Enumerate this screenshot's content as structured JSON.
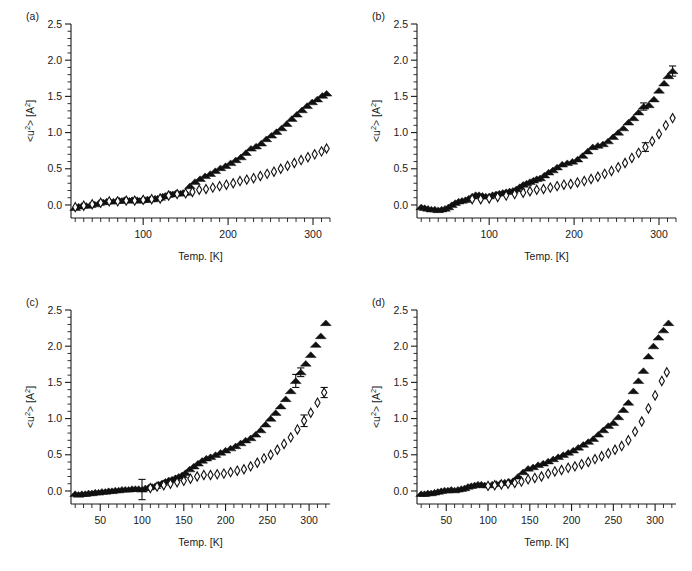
{
  "figure": {
    "background": "#ffffff",
    "ink_color": "#1a1a1a",
    "panel_labels": [
      "(a)",
      "(b)",
      "(c)",
      "(d)"
    ]
  },
  "axis": {
    "xlabel": "Temp. [K]",
    "ylabel_main": "<u",
    "ylabel_sup1": "2",
    "ylabel_mid": "> [A",
    "ylabel_sup2": "2",
    "ylabel_end": "]",
    "ylabel_plain": "<u2> [A2]"
  },
  "chart_data": [
    {
      "type": "scatter",
      "panel": "(a)",
      "title": "(a)",
      "xlabel": "Temp. [K]",
      "ylabel": "<u2> [A2]",
      "xlim": [
        15,
        320
      ],
      "ylim": [
        -0.18,
        2.5
      ],
      "xticks": [
        100,
        200,
        300
      ],
      "xticklabels": [
        "100",
        "200",
        "300"
      ],
      "xminor_step": 10,
      "yticks": [
        0.0,
        0.5,
        1.0,
        1.5,
        2.0,
        2.5
      ],
      "yticklabels": [
        "0.0",
        "0.5",
        "1.0",
        "1.5",
        "2.0",
        "2.5"
      ],
      "yminor_step": 0.1,
      "grid": false,
      "legend": "none",
      "series": [
        {
          "name": "filled-triangle",
          "marker": "triangle-up",
          "fill": "#111111",
          "x": [
            20,
            24,
            28,
            33,
            38,
            43,
            48,
            53,
            57,
            61,
            65,
            69,
            72,
            75,
            78,
            81,
            84,
            87,
            90,
            93,
            96,
            99,
            102,
            105,
            108,
            111,
            114,
            117,
            120,
            123,
            126,
            129,
            132,
            135,
            138,
            141,
            144,
            147,
            150,
            155,
            161,
            167,
            173,
            179,
            185,
            191,
            197,
            203,
            209,
            215,
            221,
            227,
            233,
            239,
            245,
            251,
            257,
            263,
            269,
            275,
            281,
            287,
            293,
            299,
            305,
            311,
            316
          ],
          "y": [
            -0.04,
            -0.02,
            -0.01,
            -0.01,
            0.0,
            0.01,
            0.03,
            0.04,
            0.05,
            0.05,
            0.05,
            0.06,
            0.06,
            0.06,
            0.07,
            0.07,
            0.06,
            0.07,
            0.07,
            0.07,
            0.06,
            0.07,
            0.07,
            0.08,
            0.08,
            0.08,
            0.09,
            0.09,
            0.1,
            0.12,
            0.13,
            0.14,
            0.15,
            0.15,
            0.16,
            0.16,
            0.16,
            0.17,
            0.17,
            0.26,
            0.32,
            0.36,
            0.4,
            0.43,
            0.47,
            0.51,
            0.54,
            0.58,
            0.62,
            0.66,
            0.72,
            0.78,
            0.81,
            0.85,
            0.91,
            0.96,
            1.01,
            1.06,
            1.12,
            1.19,
            1.25,
            1.31,
            1.37,
            1.42,
            1.46,
            1.51,
            1.54
          ]
        },
        {
          "name": "open-diamond",
          "marker": "diamond-open",
          "fill": "none",
          "x": [
            20,
            30,
            40,
            50,
            60,
            70,
            80,
            90,
            100,
            110,
            120,
            130,
            140,
            150,
            158,
            166,
            174,
            182,
            190,
            198,
            206,
            214,
            222,
            230,
            238,
            246,
            254,
            262,
            270,
            278,
            286,
            294,
            302,
            310,
            316
          ],
          "y": [
            -0.03,
            -0.01,
            0.01,
            0.03,
            0.05,
            0.05,
            0.06,
            0.06,
            0.07,
            0.08,
            0.09,
            0.13,
            0.15,
            0.16,
            0.18,
            0.21,
            0.22,
            0.24,
            0.26,
            0.28,
            0.3,
            0.33,
            0.35,
            0.37,
            0.4,
            0.43,
            0.46,
            0.5,
            0.54,
            0.58,
            0.62,
            0.66,
            0.7,
            0.74,
            0.78
          ]
        }
      ]
    },
    {
      "type": "scatter",
      "panel": "(b)",
      "title": "(b)",
      "xlabel": "Temp. [K]",
      "ylabel": "<u2> [A2]",
      "xlim": [
        15,
        320
      ],
      "ylim": [
        -0.18,
        2.5
      ],
      "xticks": [
        100,
        200,
        300
      ],
      "xticklabels": [
        "100",
        "200",
        "300"
      ],
      "xminor_step": 10,
      "yticks": [
        0.0,
        0.5,
        1.0,
        1.5,
        2.0,
        2.5
      ],
      "yticklabels": [
        "0.0",
        "0.5",
        "1.0",
        "1.5",
        "2.0",
        "2.5"
      ],
      "yminor_step": 0.1,
      "grid": false,
      "legend": "none",
      "series": [
        {
          "name": "filled-triangle",
          "marker": "triangle-up",
          "fill": "#111111",
          "x": [
            20,
            24,
            28,
            32,
            36,
            40,
            44,
            48,
            52,
            56,
            60,
            64,
            68,
            72,
            76,
            80,
            84,
            88,
            92,
            96,
            100,
            104,
            108,
            112,
            116,
            120,
            124,
            128,
            132,
            136,
            140,
            144,
            148,
            152,
            156,
            160,
            165,
            170,
            175,
            180,
            186,
            192,
            198,
            204,
            210,
            216,
            222,
            228,
            234,
            240,
            246,
            252,
            258,
            264,
            270,
            276,
            282,
            288,
            294,
            300,
            306,
            311,
            316
          ],
          "y": [
            -0.03,
            -0.04,
            -0.05,
            -0.06,
            -0.06,
            -0.07,
            -0.06,
            -0.05,
            -0.03,
            0.0,
            0.03,
            0.05,
            0.06,
            0.07,
            0.09,
            0.12,
            0.14,
            0.14,
            0.13,
            0.12,
            0.12,
            0.14,
            0.15,
            0.16,
            0.17,
            0.18,
            0.19,
            0.2,
            0.22,
            0.25,
            0.28,
            0.3,
            0.32,
            0.34,
            0.36,
            0.37,
            0.41,
            0.45,
            0.48,
            0.52,
            0.56,
            0.58,
            0.6,
            0.63,
            0.68,
            0.74,
            0.8,
            0.82,
            0.84,
            0.88,
            0.94,
            1.0,
            1.06,
            1.14,
            1.2,
            1.28,
            1.36,
            1.38,
            1.46,
            1.58,
            1.68,
            1.78,
            1.85
          ],
          "errorbars": [
            {
              "x": 282,
              "y": 1.36,
              "err": 0.05
            },
            {
              "x": 316,
              "y": 1.85,
              "err": 0.07
            }
          ]
        },
        {
          "name": "open-diamond",
          "marker": "diamond-open",
          "fill": "none",
          "x": [
            80,
            90,
            100,
            110,
            120,
            130,
            140,
            148,
            156,
            164,
            172,
            180,
            188,
            196,
            204,
            212,
            220,
            228,
            236,
            244,
            252,
            260,
            268,
            276,
            284,
            292,
            300,
            308,
            316
          ],
          "y": [
            0.08,
            0.08,
            0.09,
            0.11,
            0.13,
            0.15,
            0.17,
            0.19,
            0.21,
            0.22,
            0.24,
            0.26,
            0.28,
            0.29,
            0.31,
            0.33,
            0.36,
            0.39,
            0.43,
            0.47,
            0.52,
            0.58,
            0.65,
            0.72,
            0.8,
            0.88,
            0.98,
            1.1,
            1.2
          ],
          "errorbars": [
            {
              "x": 284,
              "y": 0.8,
              "err": 0.06
            }
          ]
        }
      ]
    },
    {
      "type": "scatter",
      "panel": "(c)",
      "title": "(c)",
      "xlabel": "Temp. [K]",
      "ylabel": "<u2> [A2]",
      "xlim": [
        15,
        325
      ],
      "ylim": [
        -0.18,
        2.5
      ],
      "xticks": [
        50,
        100,
        150,
        200,
        250,
        300
      ],
      "xticklabels": [
        "50",
        "100",
        "150",
        "200",
        "250",
        "300"
      ],
      "xminor_step": 10,
      "yticks": [
        0.0,
        0.5,
        1.0,
        1.5,
        2.0,
        2.5
      ],
      "yticklabels": [
        "0.0",
        "0.5",
        "1.0",
        "1.5",
        "2.0",
        "2.5"
      ],
      "yminor_step": 0.1,
      "grid": false,
      "legend": "none",
      "series": [
        {
          "name": "filled-triangle",
          "marker": "triangle-up",
          "fill": "#111111",
          "x": [
            20,
            24,
            28,
            32,
            36,
            40,
            44,
            48,
            52,
            56,
            60,
            64,
            68,
            72,
            76,
            80,
            84,
            88,
            92,
            96,
            100,
            104,
            108,
            112,
            116,
            120,
            124,
            128,
            132,
            136,
            140,
            144,
            148,
            152,
            157,
            162,
            167,
            172,
            177,
            182,
            188,
            194,
            200,
            206,
            212,
            218,
            224,
            230,
            236,
            242,
            248,
            254,
            260,
            266,
            272,
            278,
            284,
            290,
            296,
            302,
            308,
            314,
            320
          ],
          "y": [
            -0.04,
            -0.05,
            -0.04,
            -0.04,
            -0.03,
            -0.03,
            -0.02,
            -0.02,
            -0.01,
            -0.01,
            0.0,
            0.0,
            0.01,
            0.01,
            0.02,
            0.02,
            0.02,
            0.03,
            0.03,
            0.03,
            0.02,
            0.04,
            0.05,
            0.06,
            0.07,
            0.09,
            0.11,
            0.13,
            0.15,
            0.16,
            0.18,
            0.2,
            0.22,
            0.25,
            0.3,
            0.34,
            0.38,
            0.42,
            0.45,
            0.47,
            0.5,
            0.53,
            0.56,
            0.59,
            0.62,
            0.66,
            0.7,
            0.73,
            0.78,
            0.84,
            0.92,
            1.0,
            1.08,
            1.17,
            1.27,
            1.38,
            1.52,
            1.64,
            1.76,
            1.88,
            2.02,
            2.14,
            2.32
          ],
          "errorbars": [
            {
              "x": 100,
              "y": 0.02,
              "err": 0.14
            },
            {
              "x": 284,
              "y": 1.52,
              "err": 0.09
            },
            {
              "x": 290,
              "y": 1.64,
              "err": 0.06
            }
          ]
        },
        {
          "name": "open-diamond",
          "marker": "diamond-open",
          "fill": "none",
          "x": [
            110,
            118,
            126,
            134,
            142,
            150,
            158,
            166,
            174,
            182,
            190,
            198,
            206,
            214,
            222,
            230,
            238,
            246,
            254,
            262,
            270,
            278,
            286,
            294,
            302,
            310,
            318
          ],
          "y": [
            0.04,
            0.06,
            0.08,
            0.1,
            0.12,
            0.14,
            0.17,
            0.2,
            0.22,
            0.22,
            0.23,
            0.24,
            0.26,
            0.28,
            0.3,
            0.34,
            0.39,
            0.45,
            0.5,
            0.57,
            0.65,
            0.74,
            0.85,
            0.97,
            1.08,
            1.22,
            1.36
          ],
          "errorbars": [
            {
              "x": 294,
              "y": 0.97,
              "err": 0.08
            },
            {
              "x": 318,
              "y": 1.36,
              "err": 0.07
            }
          ]
        }
      ]
    },
    {
      "type": "scatter",
      "panel": "(d)",
      "title": "(d)",
      "xlabel": "Temp. [K]",
      "ylabel": "<u2> [A2]",
      "xlim": [
        15,
        325
      ],
      "ylim": [
        -0.18,
        2.5
      ],
      "xticks": [
        50,
        100,
        150,
        200,
        250,
        300
      ],
      "xticklabels": [
        "50",
        "100",
        "150",
        "200",
        "250",
        "300"
      ],
      "xminor_step": 10,
      "yticks": [
        0.0,
        0.5,
        1.0,
        1.5,
        2.0,
        2.5
      ],
      "yticklabels": [
        "0.0",
        "0.5",
        "1.0",
        "1.5",
        "2.0",
        "2.5"
      ],
      "yminor_step": 0.1,
      "grid": false,
      "legend": "none",
      "series": [
        {
          "name": "filled-triangle",
          "marker": "triangle-up",
          "fill": "#111111",
          "x": [
            20,
            24,
            28,
            32,
            36,
            40,
            44,
            48,
            52,
            56,
            60,
            64,
            68,
            72,
            76,
            80,
            84,
            88,
            92,
            96,
            100,
            105,
            110,
            115,
            120,
            125,
            130,
            136,
            142,
            148,
            154,
            160,
            166,
            172,
            178,
            184,
            190,
            196,
            202,
            208,
            214,
            220,
            226,
            232,
            238,
            244,
            250,
            256,
            262,
            268,
            274,
            280,
            286,
            292,
            298,
            304,
            310,
            316
          ],
          "y": [
            -0.04,
            -0.04,
            -0.03,
            -0.03,
            -0.02,
            -0.01,
            0.0,
            0.01,
            0.01,
            0.02,
            0.01,
            0.02,
            0.03,
            0.04,
            0.06,
            0.07,
            0.08,
            0.09,
            0.09,
            0.08,
            0.08,
            0.09,
            0.1,
            0.11,
            0.12,
            0.13,
            0.14,
            0.2,
            0.26,
            0.31,
            0.33,
            0.36,
            0.38,
            0.41,
            0.44,
            0.47,
            0.5,
            0.53,
            0.56,
            0.6,
            0.64,
            0.68,
            0.72,
            0.78,
            0.84,
            0.9,
            0.94,
            1.02,
            1.12,
            1.22,
            1.38,
            1.52,
            1.66,
            1.86,
            2.0,
            2.12,
            2.22,
            2.32
          ]
        },
        {
          "name": "open-diamond",
          "marker": "diamond-open",
          "fill": "none",
          "x": [
            100,
            108,
            116,
            124,
            132,
            140,
            148,
            156,
            164,
            172,
            180,
            188,
            196,
            204,
            212,
            220,
            228,
            236,
            244,
            252,
            260,
            268,
            276,
            284,
            292,
            300,
            308,
            314
          ],
          "y": [
            0.07,
            0.08,
            0.09,
            0.1,
            0.11,
            0.13,
            0.16,
            0.18,
            0.2,
            0.24,
            0.27,
            0.29,
            0.32,
            0.34,
            0.37,
            0.4,
            0.44,
            0.48,
            0.52,
            0.57,
            0.62,
            0.7,
            0.82,
            0.96,
            1.14,
            1.32,
            1.52,
            1.64
          ]
        }
      ]
    }
  ]
}
